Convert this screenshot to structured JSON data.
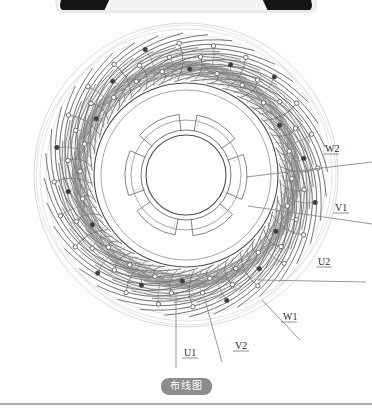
{
  "page": {
    "background_color": "#ffffff",
    "width": 372,
    "height": 414
  },
  "top_bar": {
    "name": "cut-off-toolbar",
    "fill_color": "#111111",
    "bar_color": "#1a1a1a",
    "description_visible": false
  },
  "caption": {
    "text": "布线图",
    "pill_color": "#8d8d8d",
    "text_color": "#ffffff"
  },
  "diagram": {
    "title_visible": false,
    "type": "toroidal-winding-wiring-diagram",
    "center": {
      "x": 186,
      "y": 175
    },
    "outer_radius": 152,
    "stator_outer_radius": 92,
    "stator_inner_radius": 45,
    "bore_radius": 40,
    "line_color": "#5b5b5b",
    "light_line_color": "#c9c9c9",
    "marker_fill_dark": "#3a3a3a",
    "marker_fill_light": "#ffffff",
    "slot_count": 72,
    "stator_segments": 6,
    "winding_loops": 36,
    "lead_labels": [
      {
        "id": "W2",
        "text": "W2",
        "x": 325,
        "y": 152,
        "anchor_x": 246,
        "anchor_y": 177,
        "tip_x": 372,
        "tip_y": 162
      },
      {
        "id": "V1",
        "text": "V1",
        "x": 335,
        "y": 211,
        "anchor_x": 248,
        "anchor_y": 206,
        "tip_x": 372,
        "tip_y": 224
      },
      {
        "id": "U2",
        "text": "U2",
        "x": 318,
        "y": 265,
        "anchor_x": 258,
        "anchor_y": 280,
        "tip_x": 366,
        "tip_y": 282
      },
      {
        "id": "W1",
        "text": "W1",
        "x": 283,
        "y": 320,
        "anchor_x": 262,
        "anchor_y": 300,
        "tip_x": 300,
        "tip_y": 340
      },
      {
        "id": "V2",
        "text": "V2",
        "x": 235,
        "y": 349,
        "anchor_x": 205,
        "anchor_y": 300,
        "tip_x": 222,
        "tip_y": 362
      },
      {
        "id": "U1",
        "text": "U1",
        "x": 184,
        "y": 356,
        "anchor_x": 176,
        "anchor_y": 292,
        "tip_x": 176,
        "tip_y": 368
      }
    ],
    "slot_numbers_visible": [
      "1",
      "3",
      "5",
      "7",
      "9",
      "11",
      "13",
      "15",
      "17",
      "19",
      "21",
      "23",
      "25",
      "27",
      "29",
      "31",
      "33",
      "35",
      "37",
      "39",
      "41",
      "43",
      "45",
      "47",
      "49",
      "51",
      "53",
      "55",
      "57",
      "59",
      "61",
      "63",
      "65",
      "67",
      "69",
      "71"
    ]
  }
}
